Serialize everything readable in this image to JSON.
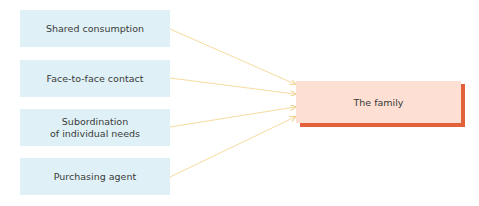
{
  "diagram": {
    "sources": [
      {
        "label": "Shared consumption"
      },
      {
        "label": "Face-to-face contact"
      },
      {
        "label": "Subordination\nof individual needs"
      },
      {
        "label": "Purchasing agent"
      }
    ],
    "target": {
      "label": "The family"
    },
    "colors": {
      "source_fill": "#dff1f6",
      "target_fill": "#fde0d3",
      "target_shadow": "#e2613a",
      "arrow": "#f5dca0"
    }
  }
}
